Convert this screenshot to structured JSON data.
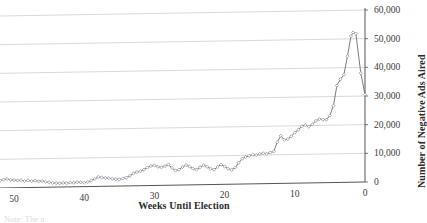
{
  "chart_data": {
    "type": "line",
    "title": "",
    "xlabel": "Weeks Until Election",
    "ylabel": "Number of Negative Ads Aired",
    "xlim": [
      52,
      0
    ],
    "ylim": [
      0,
      60000
    ],
    "x_ticks": [
      "50",
      "40",
      "30",
      "20",
      "10",
      "0"
    ],
    "x_tick_values": [
      50,
      40,
      30,
      20,
      10,
      0
    ],
    "y_ticks": [
      "0",
      "10,000",
      "20,000",
      "30,000",
      "40,000",
      "50,000",
      "60,000"
    ],
    "y_tick_values": [
      0,
      10000,
      20000,
      30000,
      40000,
      50000,
      60000
    ],
    "grid": "horizontal",
    "legend": "none",
    "marker": "diamond",
    "line_color": "#6b6b78",
    "marker_color": "#8a8a96",
    "grid_color": "#c8c8c8",
    "axis_color": "#555555",
    "series": [
      {
        "name": "Negative Ads Aired",
        "x": [
          52,
          51,
          50,
          49,
          48,
          47,
          46,
          45,
          44,
          43,
          42,
          41,
          40,
          39,
          38,
          37,
          36,
          35,
          34,
          33,
          32,
          31,
          30,
          29,
          28,
          27,
          26,
          25,
          24,
          23,
          22,
          21,
          20,
          19,
          18,
          17,
          16,
          15,
          14,
          13,
          12,
          11,
          10,
          9,
          8,
          7,
          6,
          5,
          4,
          3,
          2,
          1,
          0
        ],
        "values": [
          2600,
          2900,
          3100,
          2800,
          2600,
          2500,
          2400,
          2200,
          2000,
          1700,
          1500,
          1400,
          1500,
          1600,
          1700,
          1600,
          1500,
          1600,
          1800,
          2000,
          2200,
          2400,
          3600,
          4200,
          3900,
          3400,
          3000,
          2700,
          2600,
          2900,
          3400,
          4200,
          5200,
          6200,
          7200,
          6900,
          7800,
          6100,
          5200,
          6400,
          7200,
          6600,
          5700,
          6900,
          7500,
          6600,
          5800,
          7400,
          6200,
          5400,
          5100,
          52200,
          30500
        ]
      }
    ],
    "series_points": [
      {
        "x": 52,
        "y": 2600
      },
      {
        "x": 51.5,
        "y": 2900
      },
      {
        "x": 51,
        "y": 3100
      },
      {
        "x": 50.5,
        "y": 2800
      },
      {
        "x": 50,
        "y": 2700
      },
      {
        "x": 49.5,
        "y": 2500
      },
      {
        "x": 49,
        "y": 2600
      },
      {
        "x": 48.5,
        "y": 2300
      },
      {
        "x": 48,
        "y": 2500
      },
      {
        "x": 47.5,
        "y": 2200
      },
      {
        "x": 47,
        "y": 2400
      },
      {
        "x": 46.5,
        "y": 2100
      },
      {
        "x": 46,
        "y": 2200
      },
      {
        "x": 45.5,
        "y": 1900
      },
      {
        "x": 45,
        "y": 1700
      },
      {
        "x": 44.5,
        "y": 1500
      },
      {
        "x": 44,
        "y": 1400
      },
      {
        "x": 43.5,
        "y": 1300
      },
      {
        "x": 43,
        "y": 1400
      },
      {
        "x": 42.5,
        "y": 1300
      },
      {
        "x": 42,
        "y": 1500
      },
      {
        "x": 41.5,
        "y": 1400
      },
      {
        "x": 41,
        "y": 1600
      },
      {
        "x": 40.5,
        "y": 1500
      },
      {
        "x": 40,
        "y": 1400
      },
      {
        "x": 39.5,
        "y": 1600
      },
      {
        "x": 39,
        "y": 2100
      },
      {
        "x": 38.5,
        "y": 2600
      },
      {
        "x": 38,
        "y": 3300
      },
      {
        "x": 37.5,
        "y": 3100
      },
      {
        "x": 37,
        "y": 2900
      },
      {
        "x": 36.5,
        "y": 2800
      },
      {
        "x": 36,
        "y": 2600
      },
      {
        "x": 35.5,
        "y": 2400
      },
      {
        "x": 35,
        "y": 2300
      },
      {
        "x": 34.5,
        "y": 2600
      },
      {
        "x": 34,
        "y": 2900
      },
      {
        "x": 33.5,
        "y": 3500
      },
      {
        "x": 33,
        "y": 4300
      },
      {
        "x": 32.5,
        "y": 4800
      },
      {
        "x": 32,
        "y": 5000
      },
      {
        "x": 31.5,
        "y": 5600
      },
      {
        "x": 31,
        "y": 6300
      },
      {
        "x": 30.5,
        "y": 6800
      },
      {
        "x": 30,
        "y": 7000
      },
      {
        "x": 29.5,
        "y": 6500
      },
      {
        "x": 29,
        "y": 6300
      },
      {
        "x": 28.5,
        "y": 6700
      },
      {
        "x": 28,
        "y": 7200
      },
      {
        "x": 27.5,
        "y": 6000
      },
      {
        "x": 27,
        "y": 5100
      },
      {
        "x": 26.5,
        "y": 5400
      },
      {
        "x": 26,
        "y": 6300
      },
      {
        "x": 25.5,
        "y": 6900
      },
      {
        "x": 25,
        "y": 6400
      },
      {
        "x": 24.5,
        "y": 5600
      },
      {
        "x": 24,
        "y": 5300
      },
      {
        "x": 23.5,
        "y": 6100
      },
      {
        "x": 23,
        "y": 6800
      },
      {
        "x": 22.5,
        "y": 6200
      },
      {
        "x": 22,
        "y": 5500
      },
      {
        "x": 21.5,
        "y": 5200
      },
      {
        "x": 21,
        "y": 6100
      },
      {
        "x": 20.5,
        "y": 6900
      },
      {
        "x": 20,
        "y": 6200
      },
      {
        "x": 19.5,
        "y": 5400
      },
      {
        "x": 19,
        "y": 5000
      },
      {
        "x": 18.5,
        "y": 5800
      },
      {
        "x": 18,
        "y": 7400
      },
      {
        "x": 17.5,
        "y": 8800
      },
      {
        "x": 17,
        "y": 9400
      },
      {
        "x": 16.5,
        "y": 9800
      },
      {
        "x": 16,
        "y": 10200
      },
      {
        "x": 15.5,
        "y": 10000
      },
      {
        "x": 15,
        "y": 10400
      },
      {
        "x": 14.5,
        "y": 10600
      },
      {
        "x": 14,
        "y": 10400
      },
      {
        "x": 13.5,
        "y": 10800
      },
      {
        "x": 13,
        "y": 11200
      },
      {
        "x": 12.5,
        "y": 14400
      },
      {
        "x": 12,
        "y": 16600
      },
      {
        "x": 11.5,
        "y": 15200
      },
      {
        "x": 11,
        "y": 15400
      },
      {
        "x": 10.5,
        "y": 16400
      },
      {
        "x": 10,
        "y": 17600
      },
      {
        "x": 9.5,
        "y": 18600
      },
      {
        "x": 9,
        "y": 19800
      },
      {
        "x": 8.5,
        "y": 20200
      },
      {
        "x": 8,
        "y": 19600
      },
      {
        "x": 7.5,
        "y": 20400
      },
      {
        "x": 7,
        "y": 21600
      },
      {
        "x": 6.5,
        "y": 22200
      },
      {
        "x": 6,
        "y": 22000
      },
      {
        "x": 5.5,
        "y": 22000
      },
      {
        "x": 5,
        "y": 23400
      },
      {
        "x": 4.5,
        "y": 26800
      },
      {
        "x": 4,
        "y": 33800
      },
      {
        "x": 3.5,
        "y": 36000
      },
      {
        "x": 3,
        "y": 37600
      },
      {
        "x": 2.5,
        "y": 44000
      },
      {
        "x": 2,
        "y": 51000
      },
      {
        "x": 1.7,
        "y": 52200
      },
      {
        "x": 1.3,
        "y": 51800
      },
      {
        "x": 0.6,
        "y": 38000
      },
      {
        "x": 0,
        "y": 30500
      }
    ]
  },
  "caption_fragment": "Note: The n"
}
